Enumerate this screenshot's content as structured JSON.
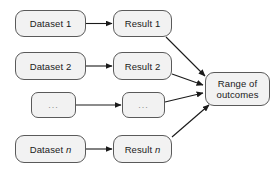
{
  "diagram": {
    "type": "flowchart",
    "style": {
      "node_fill": "#f2f2f2",
      "node_stroke": "#5a5a5a",
      "arrow_color": "#1a1a1a",
      "background": "#ffffff",
      "text_color": "#1a1a1a",
      "ellipsis_color": "#8c8c8c"
    },
    "nodes": {
      "dataset_1": "Dataset 1",
      "dataset_2": "Dataset 2",
      "dataset_dots": "...",
      "dataset_n_prefix": "Dataset ",
      "dataset_n_suffix": "n",
      "result_1": "Result 1",
      "result_2": "Result 2",
      "result_dots": "...",
      "result_n_prefix": "Result ",
      "result_n_suffix": "n",
      "outcome": "Range of\noutcomes"
    },
    "edges": [
      {
        "from": "dataset_1",
        "to": "result_1",
        "kind": "horizontal"
      },
      {
        "from": "dataset_2",
        "to": "result_2",
        "kind": "horizontal"
      },
      {
        "from": "dataset_dots",
        "to": "result_dots",
        "kind": "horizontal"
      },
      {
        "from": "dataset_n",
        "to": "result_n",
        "kind": "horizontal"
      },
      {
        "from": "result_1",
        "to": "outcome",
        "kind": "diagonal-down"
      },
      {
        "from": "result_2",
        "to": "outcome",
        "kind": "diagonal-down"
      },
      {
        "from": "result_dots",
        "to": "outcome",
        "kind": "diagonal-up"
      },
      {
        "from": "result_n",
        "to": "outcome",
        "kind": "diagonal-up"
      }
    ]
  }
}
